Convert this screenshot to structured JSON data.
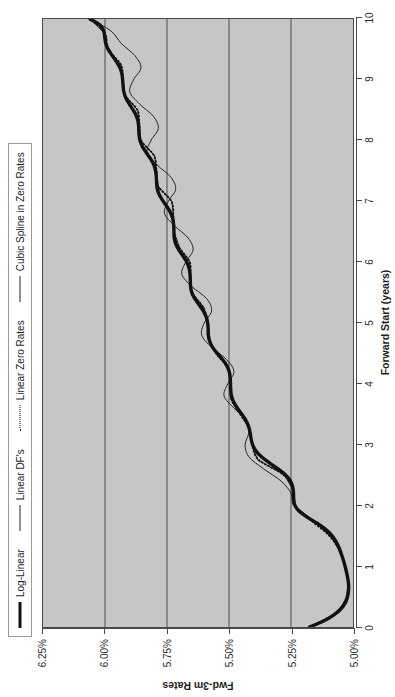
{
  "chart_data": {
    "type": "line",
    "title": "",
    "xlabel": "Forward Start (years)",
    "ylabel": "Fwd-3m Rates",
    "xlim": [
      0,
      10
    ],
    "ylim": [
      5.0,
      6.25
    ],
    "xticks": [
      0,
      1,
      2,
      3,
      4,
      5,
      6,
      7,
      8,
      9,
      10
    ],
    "xticklabels": [
      "0",
      "1",
      "2",
      "3",
      "4",
      "5",
      "6",
      "7",
      "8",
      "9",
      "10"
    ],
    "yticks": [
      5.0,
      5.25,
      5.5,
      5.75,
      6.0,
      6.25
    ],
    "yticklabels": [
      "5.00%",
      "5.25%",
      "5.50%",
      "5.75%",
      "6.00%",
      "6.25%"
    ],
    "grid": "vertical gridlines at y ticks only (horizontal in rotated view)",
    "panel_background": "#c6c6c6",
    "gridline_color": "#4a4a4a",
    "legend_position": "top-left, horizontal, outside panel",
    "series": [
      {
        "name": "Log-Linear",
        "style": "solid-thick",
        "color": "#111111",
        "x": [
          0.0,
          0.1,
          0.2,
          0.3,
          0.4,
          0.5,
          0.6,
          0.7,
          0.8,
          0.9,
          1.0,
          1.1,
          1.2,
          1.3,
          1.4,
          1.5,
          1.6,
          1.7,
          1.8,
          1.9,
          2.0,
          2.1,
          2.2,
          2.3,
          2.4,
          2.5,
          2.6,
          2.7,
          2.8,
          2.9,
          3.0,
          3.1,
          3.2,
          3.3,
          3.4,
          3.5,
          3.6,
          3.7,
          3.8,
          3.9,
          4.0,
          4.1,
          4.2,
          4.3,
          4.4,
          4.5,
          4.6,
          4.7,
          4.8,
          4.9,
          5.0,
          5.1,
          5.2,
          5.3,
          5.4,
          5.5,
          5.6,
          5.7,
          5.8,
          5.9,
          6.0,
          6.1,
          6.2,
          6.3,
          6.4,
          6.5,
          6.6,
          6.7,
          6.8,
          6.9,
          7.0,
          7.1,
          7.2,
          7.3,
          7.4,
          7.5,
          7.6,
          7.7,
          7.8,
          7.9,
          8.0,
          8.1,
          8.2,
          8.3,
          8.4,
          8.5,
          8.6,
          8.7,
          8.8,
          8.9,
          9.0,
          9.1,
          9.2,
          9.3,
          9.4,
          9.5,
          9.6,
          9.7,
          9.8,
          9.9,
          10.0
        ],
        "y": [
          5.175,
          5.118,
          5.077,
          5.049,
          5.032,
          5.022,
          5.018,
          5.018,
          5.021,
          5.026,
          5.032,
          5.039,
          5.047,
          5.056,
          5.068,
          5.084,
          5.108,
          5.142,
          5.182,
          5.216,
          5.234,
          5.239,
          5.24,
          5.243,
          5.252,
          5.272,
          5.302,
          5.337,
          5.369,
          5.392,
          5.405,
          5.411,
          5.415,
          5.421,
          5.432,
          5.448,
          5.466,
          5.481,
          5.49,
          5.493,
          5.494,
          5.495,
          5.499,
          5.509,
          5.526,
          5.547,
          5.566,
          5.578,
          5.583,
          5.584,
          5.586,
          5.592,
          5.604,
          5.621,
          5.638,
          5.65,
          5.655,
          5.656,
          5.657,
          5.661,
          5.67,
          5.685,
          5.702,
          5.715,
          5.721,
          5.722,
          5.723,
          5.726,
          5.734,
          5.748,
          5.765,
          5.78,
          5.789,
          5.792,
          5.793,
          5.796,
          5.803,
          5.816,
          5.833,
          5.849,
          5.859,
          5.863,
          5.864,
          5.866,
          5.873,
          5.886,
          5.902,
          5.916,
          5.924,
          5.927,
          5.929,
          5.932,
          5.94,
          5.954,
          5.971,
          5.987,
          5.997,
          6.001,
          6.005,
          6.02,
          6.06
        ]
      },
      {
        "name": "Linear DF's",
        "style": "solid-thin",
        "color": "#222222",
        "x": [
          0.0,
          0.25,
          0.5,
          0.75,
          1.0,
          1.25,
          1.5,
          1.75,
          2.0,
          2.25,
          2.5,
          2.75,
          3.0,
          3.25,
          3.5,
          3.75,
          4.0,
          4.25,
          4.5,
          4.75,
          5.0,
          5.25,
          5.5,
          5.75,
          6.0,
          6.25,
          6.5,
          6.75,
          7.0,
          7.25,
          7.5,
          7.75,
          8.0,
          8.25,
          8.5,
          8.75,
          9.0,
          9.25,
          9.5,
          9.75,
          10.0
        ],
        "y": [
          5.175,
          5.055,
          5.025,
          5.02,
          5.03,
          5.052,
          5.09,
          5.16,
          5.236,
          5.242,
          5.275,
          5.385,
          5.408,
          5.418,
          5.452,
          5.492,
          5.495,
          5.502,
          5.55,
          5.585,
          5.586,
          5.6,
          5.65,
          5.657,
          5.658,
          5.7,
          5.722,
          5.724,
          5.73,
          5.785,
          5.793,
          5.8,
          5.855,
          5.862,
          5.868,
          5.92,
          5.928,
          5.935,
          5.99,
          5.998,
          6.06
        ]
      },
      {
        "name": "Linear Zero Rates",
        "style": "dotted",
        "color": "#111111",
        "x": [
          0.0,
          0.25,
          0.5,
          0.75,
          1.0,
          1.25,
          1.5,
          1.75,
          2.0,
          2.25,
          2.5,
          2.75,
          3.0,
          3.25,
          3.5,
          3.75,
          4.0,
          4.25,
          4.5,
          4.75,
          5.0,
          5.25,
          5.5,
          5.75,
          6.0,
          6.25,
          6.5,
          6.75,
          7.0,
          7.25,
          7.5,
          7.75,
          8.0,
          8.25,
          8.5,
          8.75,
          9.0,
          9.25,
          9.5,
          9.75,
          10.0
        ],
        "y": [
          5.175,
          5.06,
          5.026,
          5.02,
          5.031,
          5.054,
          5.095,
          5.168,
          5.235,
          5.241,
          5.28,
          5.38,
          5.407,
          5.417,
          5.455,
          5.491,
          5.494,
          5.503,
          5.552,
          5.584,
          5.586,
          5.603,
          5.648,
          5.656,
          5.658,
          5.702,
          5.721,
          5.724,
          5.732,
          5.786,
          5.792,
          5.802,
          5.854,
          5.861,
          5.869,
          5.919,
          5.927,
          5.936,
          5.988,
          5.999,
          6.055
        ]
      },
      {
        "name": "Cubic Spline in Zero Rates",
        "style": "solid-thin-oscillating",
        "color": "#222222",
        "x": [
          0.0,
          0.2,
          0.4,
          0.6,
          0.8,
          1.0,
          1.2,
          1.4,
          1.6,
          1.8,
          2.0,
          2.2,
          2.4,
          2.6,
          2.8,
          3.0,
          3.2,
          3.4,
          3.6,
          3.8,
          4.0,
          4.2,
          4.4,
          4.6,
          4.8,
          5.0,
          5.2,
          5.4,
          5.6,
          5.8,
          6.0,
          6.2,
          6.4,
          6.6,
          6.8,
          7.0,
          7.2,
          7.4,
          7.6,
          7.8,
          8.0,
          8.2,
          8.4,
          8.6,
          8.8,
          9.0,
          9.2,
          9.4,
          9.6,
          9.8,
          10.0
        ],
        "y": [
          5.175,
          5.07,
          5.025,
          5.02,
          5.022,
          5.03,
          5.048,
          5.075,
          5.12,
          5.185,
          5.24,
          5.25,
          5.29,
          5.36,
          5.42,
          5.435,
          5.42,
          5.43,
          5.48,
          5.52,
          5.505,
          5.48,
          5.51,
          5.57,
          5.61,
          5.6,
          5.57,
          5.59,
          5.65,
          5.69,
          5.675,
          5.645,
          5.665,
          5.72,
          5.76,
          5.745,
          5.715,
          5.735,
          5.79,
          5.83,
          5.815,
          5.785,
          5.805,
          5.86,
          5.9,
          5.885,
          5.855,
          5.88,
          5.935,
          5.975,
          6.06
        ]
      }
    ]
  },
  "legend": {
    "entries": [
      {
        "label": "Log-Linear",
        "key": "thick-line-key"
      },
      {
        "label": "Linear DF's",
        "key": "thin-line-key"
      },
      {
        "label": "Linear Zero Rates",
        "key": "dotted-line-key"
      },
      {
        "label": "Cubic Spline in Zero Rates",
        "key": "thin-line-key"
      }
    ]
  }
}
